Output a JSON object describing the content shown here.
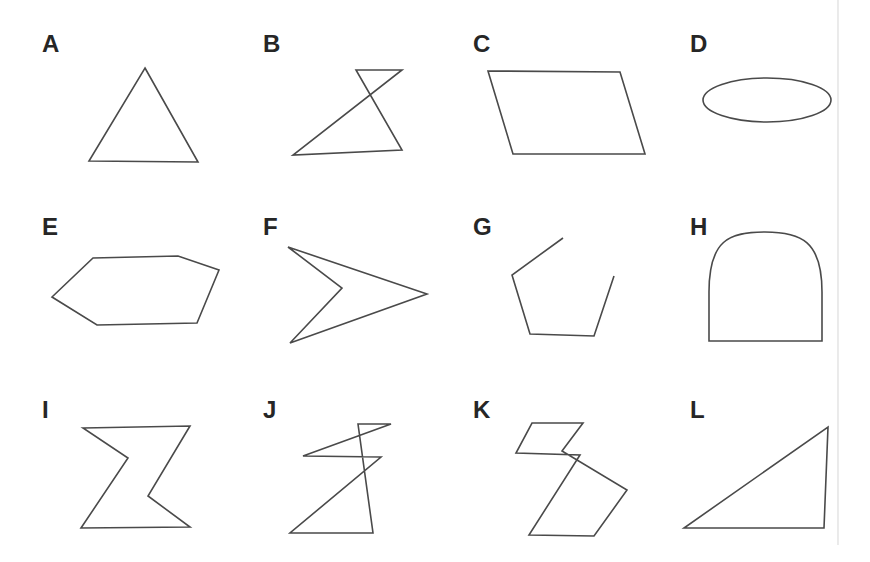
{
  "page": {
    "background_color": "#ffffff",
    "stroke_color": "#4a4a4a",
    "label_color": "#262626",
    "edge_rule_color": "#e2e2e2",
    "width": 870,
    "height": 562
  },
  "grid": {
    "rows": 3,
    "columns": 4
  },
  "shapes": [
    {
      "label": "A",
      "name": "triangle",
      "row": 1,
      "column": 1,
      "closed": true,
      "label_x": 42,
      "label_y": 52,
      "kind": "polygon",
      "points": "145,68 198,162 89,161"
    },
    {
      "label": "B",
      "name": "self-intersecting-quadrilateral",
      "row": 1,
      "column": 2,
      "closed": true,
      "label_x": 263,
      "label_y": 52,
      "kind": "polygon",
      "points": "356,70 402,70 293,155 402,150"
    },
    {
      "label": "C",
      "name": "parallelogram",
      "row": 1,
      "column": 3,
      "closed": true,
      "label_x": 473,
      "label_y": 52,
      "kind": "polygon",
      "points": "488,71 620,72 645,154 513,154"
    },
    {
      "label": "D",
      "name": "ellipse",
      "row": 1,
      "column": 4,
      "closed": true,
      "label_x": 690,
      "label_y": 52,
      "kind": "ellipse",
      "cx": 767,
      "cy": 100,
      "rx": 64,
      "ry": 22
    },
    {
      "label": "E",
      "name": "hexagon",
      "row": 2,
      "column": 1,
      "closed": true,
      "label_x": 42,
      "label_y": 235,
      "kind": "polygon",
      "points": "52,297 93,258 178,256 219,270 197,323 97,325"
    },
    {
      "label": "F",
      "name": "concave-arrowhead",
      "row": 2,
      "column": 2,
      "closed": true,
      "label_x": 263,
      "label_y": 235,
      "kind": "polygon",
      "points": "288,247 427,294 290,343 342,288"
    },
    {
      "label": "G",
      "name": "open-polyline-pentagon",
      "row": 2,
      "column": 3,
      "closed": false,
      "label_x": 473,
      "label_y": 235,
      "kind": "polyline",
      "points": "563,238 512,275 530,334 594,336 614,276"
    },
    {
      "label": "H",
      "name": "arch-dome",
      "row": 2,
      "column": 4,
      "closed": true,
      "label_x": 690,
      "label_y": 235,
      "kind": "path",
      "d": "M 709,341 L 709,292 C 709,240 729,232 765,232 C 801,232 822,241 822,292 L 822,341 Z"
    },
    {
      "label": "I",
      "name": "zigzag-hexagon",
      "row": 3,
      "column": 1,
      "closed": true,
      "label_x": 42,
      "label_y": 418,
      "kind": "polygon",
      "points": "83,428 190,426 148,496 190,527 81,528 128,458"
    },
    {
      "label": "J",
      "name": "double-bowtie-hexagon",
      "row": 3,
      "column": 2,
      "closed": true,
      "label_x": 263,
      "label_y": 418,
      "kind": "polygon",
      "points": "358,424 391,424 303,456 381,457 290,533 373,533"
    },
    {
      "label": "K",
      "name": "self-intersecting-octagon",
      "row": 3,
      "column": 3,
      "closed": true,
      "label_x": 473,
      "label_y": 418,
      "kind": "polygon",
      "points": "532,423 583,423 562,451 627,490 594,536 529,535 580,455 516,453"
    },
    {
      "label": "L",
      "name": "right-triangle",
      "row": 3,
      "column": 4,
      "closed": true,
      "label_x": 690,
      "label_y": 418,
      "kind": "polygon",
      "points": "684,528 824,528 828,427"
    }
  ],
  "artifacts": {
    "right_edge_rule": {
      "x": 838,
      "y1": 0,
      "y2": 545
    }
  }
}
